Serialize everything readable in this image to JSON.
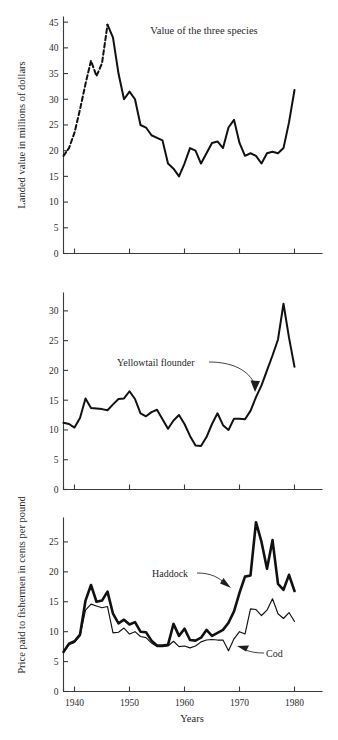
{
  "figure": {
    "caption_title": "Value of the three species",
    "xlabel": "Years",
    "ylabel_top": "Landed value in millions of dollars",
    "ylabel_bottom": "Price paid to fishermen in cents per pound"
  },
  "annotations": {
    "yellowtail": "Yellowtail flounder",
    "haddock": "Haddock",
    "cod": "Cod"
  },
  "xticks": [
    "1940",
    "1950",
    "1960",
    "1970",
    "1980"
  ],
  "panel1_yticks": [
    "0",
    "5",
    "10",
    "15",
    "20",
    "25",
    "30",
    "35",
    "40",
    "45"
  ],
  "panel2_yticks": [
    "0",
    "5",
    "10",
    "15",
    "20",
    "25",
    "30"
  ],
  "panel3_yticks": [
    "0",
    "5",
    "10",
    "15",
    "20",
    "25"
  ],
  "chart_data": [
    {
      "type": "line",
      "panel": 1,
      "title": "Value of the three species",
      "xlabel": "Years",
      "ylabel": "Landed value in millions of dollars",
      "xlim": [
        1938,
        1985
      ],
      "ylim": [
        0,
        46
      ],
      "yticks": [
        0,
        5,
        10,
        15,
        20,
        25,
        30,
        35,
        40,
        45
      ],
      "xticks": [
        1940,
        1950,
        1960,
        1970,
        1980
      ],
      "grid": false,
      "legend": "none",
      "series": [
        {
          "name": "Landed value (estimated / dashed segment)",
          "style": "dashed",
          "x": [
            1938,
            1939,
            1940,
            1941,
            1942,
            1943,
            1944,
            1945,
            1946
          ],
          "values": [
            19.0,
            20.5,
            23.5,
            28.0,
            33.0,
            37.5,
            34.5,
            37.0,
            44.5
          ]
        },
        {
          "name": "Landed value (recorded / solid segment)",
          "style": "solid",
          "x": [
            1938,
            1939,
            1940,
            1941,
            1942,
            1943,
            1944,
            1945,
            1946,
            1947,
            1948,
            1949,
            1950,
            1951,
            1952,
            1953,
            1954,
            1955,
            1956,
            1957,
            1958,
            1959,
            1960,
            1961,
            1962,
            1963,
            1964,
            1965,
            1966,
            1967,
            1968,
            1969,
            1970,
            1971,
            1972,
            1973,
            1974,
            1975,
            1976,
            1977,
            1978,
            1979,
            1980
          ],
          "values": [
            19.0,
            20.5,
            23.5,
            28.0,
            33.0,
            37.5,
            34.5,
            37.0,
            44.5,
            42.0,
            35.0,
            30.0,
            31.5,
            30.0,
            25.0,
            24.5,
            23.0,
            22.5,
            22.0,
            17.5,
            16.5,
            15.0,
            17.5,
            20.5,
            20.0,
            17.5,
            19.5,
            21.5,
            21.8,
            20.5,
            24.5,
            26.0,
            21.5,
            19.0,
            19.5,
            19.0,
            17.5,
            19.5,
            19.8,
            19.5,
            20.5,
            25.5,
            31.8
          ]
        }
      ]
    },
    {
      "type": "line",
      "panel": 2,
      "title": "",
      "xlabel": "Years",
      "ylabel": "Price paid to fishermen in cents per pound",
      "xlim": [
        1938,
        1985
      ],
      "ylim": [
        0,
        33
      ],
      "yticks": [
        0,
        5,
        10,
        15,
        20,
        25,
        30
      ],
      "xticks": [
        1940,
        1950,
        1960,
        1970,
        1980
      ],
      "grid": false,
      "legend": "annotation",
      "series": [
        {
          "name": "Yellowtail flounder",
          "style": "solid",
          "x": [
            1938,
            1939,
            1940,
            1941,
            1942,
            1943,
            1944,
            1945,
            1946,
            1947,
            1948,
            1949,
            1950,
            1951,
            1952,
            1953,
            1954,
            1955,
            1956,
            1957,
            1958,
            1959,
            1960,
            1961,
            1962,
            1963,
            1964,
            1965,
            1966,
            1967,
            1968,
            1969,
            1970,
            1971,
            1972,
            1973,
            1974,
            1975,
            1976,
            1977,
            1978,
            1979,
            1980
          ],
          "values": [
            11.2,
            11.0,
            10.4,
            12.0,
            15.3,
            13.7,
            13.6,
            13.5,
            13.3,
            14.3,
            15.2,
            15.3,
            16.5,
            15.2,
            12.8,
            12.3,
            13.0,
            13.4,
            11.8,
            10.2,
            11.6,
            12.5,
            11.0,
            9.0,
            7.4,
            7.3,
            8.8,
            11.0,
            12.8,
            10.8,
            10.0,
            11.9,
            11.9,
            11.8,
            13.2,
            15.5,
            17.5,
            20.0,
            22.5,
            25.2,
            31.2,
            25.5,
            20.6
          ]
        }
      ]
    },
    {
      "type": "line",
      "panel": 3,
      "title": "",
      "xlabel": "Years",
      "ylabel": "Price paid to fishermen in cents per pound",
      "xlim": [
        1938,
        1985
      ],
      "ylim": [
        0,
        29
      ],
      "yticks": [
        0,
        5,
        10,
        15,
        20,
        25
      ],
      "xticks": [
        1940,
        1950,
        1960,
        1970,
        1980
      ],
      "grid": false,
      "legend": "annotation",
      "series": [
        {
          "name": "Haddock",
          "style": "thick",
          "x": [
            1938,
            1939,
            1940,
            1941,
            1942,
            1943,
            1944,
            1945,
            1946,
            1947,
            1948,
            1949,
            1950,
            1951,
            1952,
            1953,
            1954,
            1955,
            1956,
            1957,
            1958,
            1959,
            1960,
            1961,
            1962,
            1963,
            1964,
            1965,
            1966,
            1967,
            1968,
            1969,
            1970,
            1971,
            1972,
            1973,
            1974,
            1975,
            1976,
            1977,
            1978,
            1979,
            1980
          ],
          "values": [
            6.6,
            8.0,
            8.4,
            9.5,
            15.2,
            17.8,
            15.0,
            15.2,
            16.7,
            13.0,
            11.4,
            12.0,
            11.2,
            11.6,
            10.0,
            9.9,
            8.5,
            7.7,
            7.7,
            7.8,
            11.3,
            9.3,
            10.5,
            8.6,
            8.5,
            9.0,
            10.3,
            9.3,
            9.8,
            10.3,
            11.5,
            13.4,
            16.5,
            19.2,
            19.4,
            28.3,
            25.0,
            20.5,
            25.3,
            18.0,
            17.0,
            19.5,
            16.8
          ]
        },
        {
          "name": "Cod",
          "style": "thin",
          "x": [
            1938,
            1939,
            1940,
            1941,
            1942,
            1943,
            1944,
            1945,
            1946,
            1947,
            1948,
            1949,
            1950,
            1951,
            1952,
            1953,
            1954,
            1955,
            1956,
            1957,
            1958,
            1959,
            1960,
            1961,
            1962,
            1963,
            1964,
            1965,
            1966,
            1967,
            1968,
            1969,
            1970,
            1971,
            1972,
            1973,
            1974,
            1975,
            1976,
            1977,
            1978,
            1979,
            1980
          ],
          "values": [
            6.6,
            7.8,
            8.2,
            9.3,
            13.6,
            14.6,
            14.3,
            14.0,
            14.2,
            9.8,
            9.9,
            10.6,
            9.6,
            10.0,
            9.2,
            9.0,
            8.1,
            7.5,
            7.5,
            7.6,
            8.4,
            7.5,
            7.6,
            7.3,
            7.6,
            8.3,
            8.6,
            8.7,
            8.6,
            8.6,
            6.8,
            8.8,
            10.0,
            9.6,
            13.8,
            13.7,
            12.7,
            13.6,
            15.5,
            13.0,
            12.2,
            13.2,
            11.7
          ]
        }
      ]
    }
  ]
}
